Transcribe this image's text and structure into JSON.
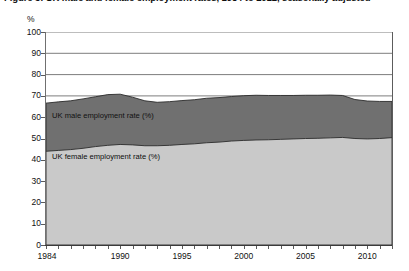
{
  "chart_data": {
    "type": "area",
    "stacked": true,
    "title": "Figure 3: UK male and female employment rates, 1984 to 2012, seasonally adjusted",
    "subtitle": "",
    "xlabel": "",
    "ylabel": "%",
    "unit_label": "%",
    "ylim": [
      0,
      100
    ],
    "y_ticks": [
      100,
      90,
      80,
      70,
      60,
      50,
      40,
      30,
      20,
      10,
      0
    ],
    "xlim": [
      1984,
      2012
    ],
    "x_tick_labels": [
      "1984",
      "1990",
      "1995",
      "2000",
      "2005",
      "2010"
    ],
    "x_tick_values": [
      1984,
      1990,
      1995,
      2000,
      2005,
      2010
    ],
    "x_minor_ticks": [
      1984,
      1985,
      1986,
      1987,
      1988,
      1989,
      1990,
      1991,
      1992,
      1993,
      1994,
      1995,
      1996,
      1997,
      1998,
      1999,
      2000,
      2001,
      2002,
      2003,
      2004,
      2005,
      2006,
      2007,
      2008,
      2009,
      2010,
      2011,
      2012
    ],
    "grid": "horizontal",
    "gridlines_visible_above": 65,
    "legend_position": "inside-plot",
    "x": [
      1984,
      1985,
      1986,
      1987,
      1988,
      1989,
      1990,
      1991,
      1992,
      1993,
      1994,
      1995,
      1996,
      1997,
      1998,
      1999,
      2000,
      2001,
      2002,
      2003,
      2004,
      2005,
      2006,
      2007,
      2008,
      2009,
      2010,
      2011,
      2012
    ],
    "series": [
      {
        "name": "UK female employment rate (%)",
        "color": "#c9c9c9",
        "values": [
          44.0,
          44.4,
          44.8,
          45.4,
          46.2,
          46.8,
          47.2,
          47.0,
          46.6,
          46.6,
          46.8,
          47.2,
          47.5,
          48.0,
          48.3,
          48.8,
          49.1,
          49.3,
          49.4,
          49.6,
          49.8,
          50.0,
          50.1,
          50.3,
          50.5,
          50.0,
          49.8,
          50.0,
          50.4
        ]
      },
      {
        "name": "UK male employment rate (%)",
        "color": "#707070",
        "values": [
          22.6,
          22.8,
          22.9,
          23.2,
          23.4,
          23.8,
          23.6,
          22.4,
          21.1,
          20.4,
          20.5,
          20.6,
          20.7,
          20.9,
          20.9,
          20.9,
          21.0,
          21.0,
          20.8,
          20.6,
          20.4,
          20.3,
          20.2,
          20.1,
          19.7,
          18.3,
          17.8,
          17.4,
          17.0
        ]
      }
    ],
    "stacked_totals": [
      66.6,
      67.2,
      67.7,
      68.6,
      69.6,
      70.6,
      70.8,
      69.4,
      67.7,
      67.0,
      67.3,
      67.8,
      68.2,
      68.9,
      69.2,
      69.7,
      70.1,
      70.3,
      70.2,
      70.2,
      70.2,
      70.3,
      70.3,
      70.4,
      70.2,
      68.3,
      67.6,
      67.4,
      67.4
    ],
    "annotations": [
      {
        "text": "UK male employment rate (%)",
        "x": 1985,
        "y": 58
      },
      {
        "text": "UK female employment rate (%)",
        "x": 1985,
        "y": 37
      }
    ]
  },
  "labels": {
    "male_series": "UK male employment rate (%)",
    "female_series": "UK female employment rate (%)",
    "unit": "%"
  },
  "colors": {
    "male_band": "#707070",
    "female_band": "#c9c9c9",
    "gridline": "#6e6e6e",
    "axis": "#3a3a3a",
    "text": "#111111"
  }
}
